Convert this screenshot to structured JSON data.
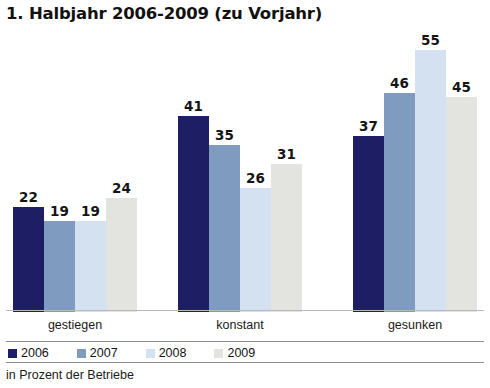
{
  "chart_data": {
    "type": "bar",
    "title": "1. Halbjahr 2006-2009 (zu Vorjahr)",
    "xlabel": "",
    "ylabel": "",
    "ylim": [
      0,
      58
    ],
    "grid": false,
    "legend_position": "bottom",
    "footnote": "in Prozent der Betriebe",
    "categories": [
      "gestiegen",
      "konstant",
      "gesunken"
    ],
    "series": [
      {
        "name": "2006",
        "color": "#1e1e64",
        "values": [
          22,
          41,
          37
        ]
      },
      {
        "name": "2007",
        "color": "#7f9bc0",
        "values": [
          19,
          35,
          46
        ]
      },
      {
        "name": "2008",
        "color": "#d3e1f0",
        "values": [
          19,
          26,
          55
        ]
      },
      {
        "name": "2009",
        "color": "#e3e3e0",
        "values": [
          24,
          31,
          45
        ]
      }
    ]
  },
  "groups": [
    {
      "label": "gestiegen",
      "bars": [
        {
          "year": "2006",
          "value": 22,
          "color": "#1e1e64"
        },
        {
          "year": "2007",
          "value": 19,
          "color": "#7f9bc0"
        },
        {
          "year": "2008",
          "value": 19,
          "color": "#d3e1f0"
        },
        {
          "year": "2009",
          "value": 24,
          "color": "#e3e3e0"
        }
      ]
    },
    {
      "label": "konstant",
      "bars": [
        {
          "year": "2006",
          "value": 41,
          "color": "#1e1e64"
        },
        {
          "year": "2007",
          "value": 35,
          "color": "#7f9bc0"
        },
        {
          "year": "2008",
          "value": 26,
          "color": "#d3e1f0"
        },
        {
          "year": "2009",
          "value": 31,
          "color": "#e3e3e0"
        }
      ]
    },
    {
      "label": "gesunken",
      "bars": [
        {
          "year": "2006",
          "value": 37,
          "color": "#1e1e64"
        },
        {
          "year": "2007",
          "value": 46,
          "color": "#7f9bc0"
        },
        {
          "year": "2008",
          "value": 55,
          "color": "#d3e1f0"
        },
        {
          "year": "2009",
          "value": 45,
          "color": "#e3e3e0"
        }
      ]
    }
  ],
  "legend": [
    {
      "label": "2006",
      "color": "#1e1e64"
    },
    {
      "label": "2007",
      "color": "#7f9bc0"
    },
    {
      "label": "2008",
      "color": "#d3e1f0"
    },
    {
      "label": "2009",
      "color": "#e3e3e0"
    }
  ]
}
